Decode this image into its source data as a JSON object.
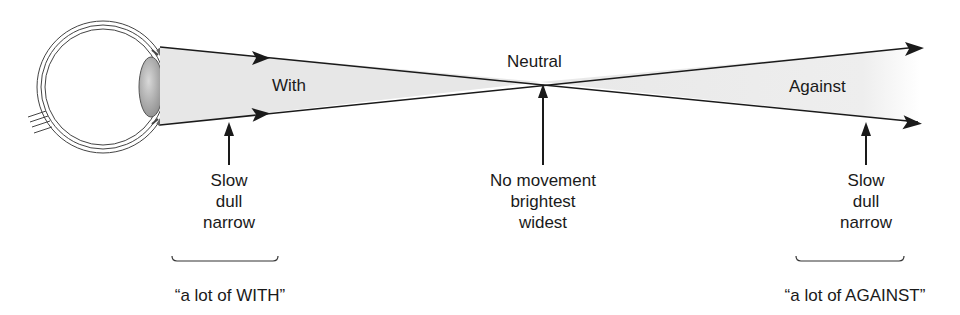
{
  "diagram": {
    "labels": {
      "with": "With",
      "neutral": "Neutral",
      "against": "Against"
    },
    "annotations": {
      "left": {
        "line1": "Slow",
        "line2": "dull",
        "line3": "narrow"
      },
      "center": {
        "line1": "No movement",
        "line2": "brightest",
        "line3": "widest"
      },
      "right": {
        "line1": "Slow",
        "line2": "dull",
        "line3": "narrow"
      }
    },
    "captions": {
      "left": "“a lot of WITH”",
      "right": "“a lot of AGAINST”"
    },
    "colors": {
      "beam_fill": "#e6e6e6",
      "line": "#1a1a1a",
      "background": "#ffffff"
    }
  }
}
